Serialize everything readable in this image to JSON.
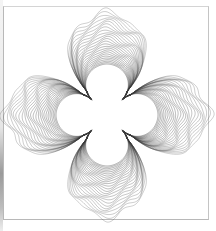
{
  "artwork": {
    "subject": "four-petal nested contour line drawing",
    "center": [
      107,
      115
    ],
    "stroke_color": "#3a3a3a",
    "background": "#ffffff",
    "frame_color": "#bcbcbc",
    "contour_count": 26,
    "inner_shape": {
      "arm_radius": 50,
      "waist_radius": 22
    },
    "outer_shape": {
      "petal_radius": 101,
      "petal_halfwidth_deg": 30,
      "wave_amplitude": 5,
      "wave_count": 3
    }
  }
}
